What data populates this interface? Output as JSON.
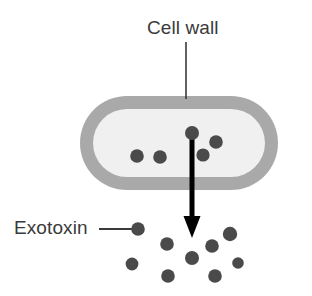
{
  "figure": {
    "kind": "biology-diagram",
    "background_color": "#ffffff"
  },
  "labels": {
    "cell_wall": "Cell wall",
    "exotoxin": "Exotoxin"
  },
  "colors": {
    "cell_wall_fill": "#a9a9a9",
    "cell_interior_fill": "#f0f0f0",
    "toxin_dot": "#4a4a4a",
    "arrow": "#000000",
    "leader_line": "#3a3a3a",
    "text": "#3a3a3a"
  },
  "cell": {
    "shape": "stadium",
    "x": 80,
    "y": 96,
    "width": 198,
    "height": 94,
    "wall_thickness": 13,
    "corner_radius": 47
  },
  "pointers": {
    "cell_wall_leader": {
      "orientation": "vertical",
      "x": 186,
      "y1": 42,
      "y2": 99,
      "stroke_width": 1.6
    },
    "exotoxin_leader": {
      "orientation": "horizontal",
      "y": 229,
      "x1": 99,
      "x2": 136,
      "stroke_width": 1.8
    }
  },
  "secretion_arrow": {
    "x": 192,
    "y_start": 133,
    "y_tip": 238,
    "shaft_width": 5,
    "head_width": 17,
    "head_length": 22
  },
  "intracellular_toxins": [
    {
      "cx": 192,
      "cy": 133,
      "r": 7.0
    },
    {
      "cx": 216,
      "cy": 142,
      "r": 6.8
    },
    {
      "cx": 203,
      "cy": 155,
      "r": 6.6
    },
    {
      "cx": 137,
      "cy": 156,
      "r": 6.8
    },
    {
      "cx": 160,
      "cy": 157,
      "r": 6.8
    }
  ],
  "extracellular_toxins": [
    {
      "cx": 138,
      "cy": 229,
      "r": 6.8,
      "labeled": true
    },
    {
      "cx": 167,
      "cy": 244,
      "r": 6.8,
      "labeled": false
    },
    {
      "cx": 132,
      "cy": 264,
      "r": 6.4,
      "labeled": false
    },
    {
      "cx": 168,
      "cy": 276,
      "r": 6.8,
      "labeled": false
    },
    {
      "cx": 192,
      "cy": 258,
      "r": 7.0,
      "labeled": false
    },
    {
      "cx": 212,
      "cy": 246,
      "r": 6.8,
      "labeled": false
    },
    {
      "cx": 215,
      "cy": 276,
      "r": 6.8,
      "labeled": false
    },
    {
      "cx": 230,
      "cy": 234,
      "r": 7.2,
      "labeled": false
    },
    {
      "cx": 238,
      "cy": 263,
      "r": 5.8,
      "labeled": false
    }
  ]
}
